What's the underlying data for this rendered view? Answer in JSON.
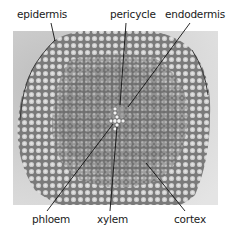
{
  "figure": {
    "labels": {
      "epidermis": "epidermis",
      "pericycle": "pericycle",
      "endodermis": "endodermis",
      "phloem": "phloem",
      "xylem": "xylem",
      "cortex": "cortex"
    },
    "colors": {
      "background": "#ffffff",
      "photo_background": "#d9d9d9",
      "tissue_dark": "#6e6e6e",
      "tissue_mid": "#9a9a9a",
      "cell_light": "#e6e6e6",
      "leader_line": "#111111",
      "label_text": "#1a1a1a"
    }
  }
}
